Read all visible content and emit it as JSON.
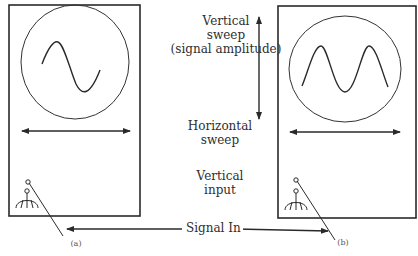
{
  "diagram": {
    "center_labels": {
      "vertical_sweep_line1": "Vertical",
      "vertical_sweep_line2": "sweep",
      "vertical_sweep_line3": "(signal amplitude)",
      "horizontal_sweep_line1": "Horizontal",
      "horizontal_sweep_line2": "sweep",
      "vertical_input_line1": "Vertical",
      "vertical_input_line2": "input"
    },
    "signal_label": "Signal In",
    "panels": [
      {
        "id": "a",
        "caption": "(a)",
        "waveform": "one-cycle sine wave"
      },
      {
        "id": "b",
        "caption": "(b)",
        "waveform": "two-peak sine wave (M shape)"
      }
    ],
    "colors": {
      "stroke": "#2a2a2a",
      "background": "#ffffff"
    }
  }
}
